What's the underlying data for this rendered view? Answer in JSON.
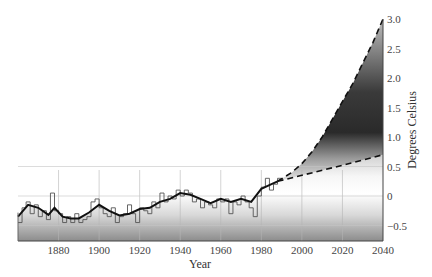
{
  "chart_data": {
    "type": "line",
    "title": "",
    "xlabel": "Year",
    "ylabel": "Degrees Celsius",
    "xlim": [
      1860,
      2040
    ],
    "ylim": [
      -0.75,
      3.0
    ],
    "grid": true,
    "y_axis_position": "right",
    "x_ticks": [
      1880,
      1900,
      1920,
      1940,
      1960,
      1980,
      2000,
      2020,
      2040
    ],
    "y_ticks": [
      3.0,
      2.5,
      2.0,
      1.5,
      1.0,
      0.5,
      0,
      -0.5
    ],
    "y_tick_labels": [
      "3.0",
      "2.5",
      "2.0",
      "1.5",
      "1.0",
      "0.5",
      "0",
      "−0.5"
    ],
    "series": [
      {
        "name": "Annual temperature anomaly",
        "style": "step",
        "x": [
          1860,
          1862,
          1864,
          1866,
          1868,
          1870,
          1872,
          1874,
          1876,
          1878,
          1880,
          1882,
          1884,
          1886,
          1888,
          1890,
          1892,
          1894,
          1896,
          1898,
          1900,
          1902,
          1904,
          1906,
          1908,
          1910,
          1912,
          1914,
          1916,
          1918,
          1920,
          1922,
          1924,
          1926,
          1928,
          1930,
          1932,
          1934,
          1936,
          1938,
          1940,
          1942,
          1944,
          1946,
          1948,
          1950,
          1952,
          1954,
          1956,
          1958,
          1960,
          1962,
          1964,
          1966,
          1968,
          1970,
          1972,
          1974,
          1976,
          1978,
          1980,
          1982,
          1984,
          1986,
          1988
        ],
        "values": [
          -0.45,
          -0.2,
          -0.1,
          -0.3,
          -0.15,
          -0.35,
          -0.25,
          -0.4,
          0.05,
          -0.25,
          -0.3,
          -0.45,
          -0.35,
          -0.45,
          -0.3,
          -0.45,
          -0.4,
          -0.35,
          -0.1,
          -0.05,
          -0.2,
          -0.3,
          -0.35,
          -0.2,
          -0.45,
          -0.35,
          -0.3,
          -0.15,
          -0.3,
          -0.45,
          -0.2,
          -0.25,
          -0.3,
          -0.1,
          -0.2,
          0.05,
          -0.1,
          0.0,
          -0.05,
          0.1,
          0.0,
          0.1,
          0.05,
          -0.1,
          -0.05,
          -0.2,
          -0.1,
          -0.15,
          -0.2,
          -0.05,
          -0.1,
          -0.05,
          -0.3,
          -0.1,
          -0.15,
          0.0,
          -0.1,
          -0.2,
          -0.35,
          0.0,
          0.15,
          0.3,
          0.1,
          0.2,
          0.3
        ]
      },
      {
        "name": "Smoothed trend",
        "style": "solid",
        "x": [
          1860,
          1865,
          1870,
          1875,
          1878,
          1882,
          1886,
          1890,
          1895,
          1900,
          1905,
          1910,
          1915,
          1920,
          1925,
          1930,
          1935,
          1940,
          1945,
          1950,
          1955,
          1960,
          1965,
          1970,
          1975,
          1980,
          1985,
          1988
        ],
        "values": [
          -0.35,
          -0.15,
          -0.2,
          -0.32,
          -0.2,
          -0.35,
          -0.38,
          -0.38,
          -0.28,
          -0.15,
          -0.25,
          -0.33,
          -0.3,
          -0.22,
          -0.2,
          -0.1,
          -0.05,
          0.05,
          0.02,
          -0.05,
          -0.12,
          -0.05,
          -0.1,
          -0.05,
          -0.1,
          0.12,
          0.2,
          0.25
        ]
      },
      {
        "name": "High projection",
        "style": "dashed",
        "x": [
          1988,
          1995,
          2000,
          2005,
          2010,
          2015,
          2020,
          2025,
          2030,
          2035,
          2040
        ],
        "values": [
          0.25,
          0.4,
          0.55,
          0.75,
          1.0,
          1.3,
          1.6,
          1.9,
          2.25,
          2.6,
          3.0
        ]
      },
      {
        "name": "Low projection",
        "style": "dashed",
        "x": [
          1988,
          2000,
          2020,
          2040
        ],
        "values": [
          0.25,
          0.35,
          0.52,
          0.7
        ]
      }
    ]
  },
  "colors": {
    "line": "#111111",
    "step": "#555555",
    "projection_fill_dark": "#2a2a2a",
    "grid": "#bbbbbb",
    "axis": "#444444"
  }
}
